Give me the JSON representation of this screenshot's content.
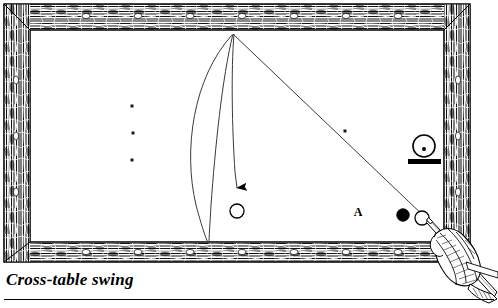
{
  "figure": {
    "caption": "Cross-table swing",
    "colors": {
      "ink": "#000000",
      "cloth": "#ffffff",
      "rail_wood_dark": "#2b2b2b",
      "rail_wood_light": "#e8e6e2",
      "line": "#3a3a3a"
    },
    "table": {
      "name": "pool-table",
      "outer_frame": {
        "x": 4,
        "y": 4,
        "width": 466,
        "height": 258
      },
      "rail_thickness": 22,
      "cloth_area": {
        "x": 30,
        "y": 30,
        "width": 414,
        "height": 212
      },
      "diamonds_top": 7,
      "diamonds_bottom": 7,
      "diamonds_left": 3,
      "diamonds_right": 3
    },
    "balls": [
      {
        "name": "object-ball-target",
        "label": "",
        "fill": "white",
        "cx": 237,
        "cy": 211,
        "r": 7
      },
      {
        "name": "object-ball-black",
        "label": "",
        "fill": "black",
        "cx": 403,
        "cy": 215,
        "r": 6
      },
      {
        "name": "cue-ball",
        "label": "",
        "fill": "white",
        "cx": 422,
        "cy": 218,
        "r": 7
      }
    ],
    "spots": [
      {
        "name": "table-spot-upper",
        "cx": 132,
        "cy": 106
      },
      {
        "name": "table-spot-middle",
        "cx": 133,
        "cy": 133
      },
      {
        "name": "table-spot-lower",
        "cx": 132,
        "cy": 160
      },
      {
        "name": "table-spot-path",
        "cx": 345,
        "cy": 131
      }
    ],
    "labels": [
      {
        "name": "point-label-a",
        "text": "A",
        "x": 358,
        "y": 216
      }
    ],
    "spin_indicator": {
      "name": "english-indicator-draw",
      "description": "circle-with-center-dot-over-bar",
      "cx": 424,
      "cy": 146,
      "r": 11,
      "dot_offset_y": 3,
      "bar": {
        "x": 409,
        "y": 160,
        "width": 32,
        "height": 5
      }
    },
    "cue": {
      "name": "cue-stick-with-hand",
      "tip_x": 428,
      "tip_y": 220,
      "butt_x": 496,
      "butt_y": 296
    },
    "paths": [
      {
        "name": "cue-ball-aim-line",
        "type": "straight",
        "from": [
          428,
          220
        ],
        "to": [
          233,
          34
        ]
      },
      {
        "name": "swing-curve-outer",
        "type": "curve",
        "from": [
          232,
          35
        ],
        "to": [
          208,
          243
        ]
      },
      {
        "name": "swing-curve-inner",
        "type": "curve",
        "from": [
          233,
          34
        ],
        "to": [
          209,
          243
        ]
      },
      {
        "name": "swing-arrow-path",
        "type": "curve",
        "from": [
          234,
          34
        ],
        "to": [
          237,
          190
        ],
        "arrow": true
      }
    ]
  }
}
